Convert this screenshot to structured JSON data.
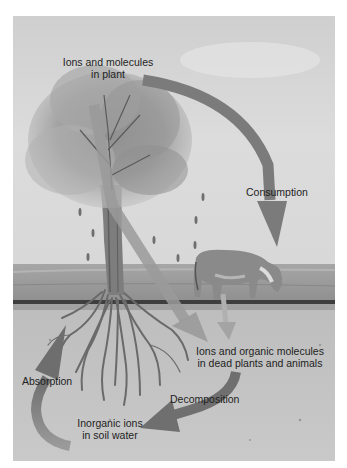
{
  "diagram": {
    "colors": {
      "background": "#ffffff",
      "sky": "#d6d6d6",
      "arrow": "#7b7b7b",
      "arrow_light": "#a8a8a8",
      "grass": "#9c9c9c",
      "soil": "#c4c4c4",
      "ground_line": "#3a3a3a",
      "text": "#1e1e1e"
    },
    "labels": {
      "plant": {
        "line1": "Ions and molecules",
        "line2": "in plant"
      },
      "consumption": "Consumption",
      "dead": {
        "line1": "Ions and organic molecules",
        "line2": "in dead plants and animals"
      },
      "decomposition": "Decomposition",
      "soil": {
        "line1": "Inorganic ions",
        "line2": "in soil water"
      },
      "absorption": "Absorption"
    },
    "elements": [
      "tree",
      "cow",
      "roots",
      "ground",
      "sky"
    ],
    "arrows": [
      {
        "name": "consumption",
        "from": "plant",
        "to": "cow"
      },
      {
        "name": "plant-to-dead",
        "from": "plant",
        "to": "dead plants and animals"
      },
      {
        "name": "animal-to-dead",
        "from": "cow",
        "to": "dead plants and animals"
      },
      {
        "name": "decomposition",
        "from": "dead plants and animals",
        "to": "soil water"
      },
      {
        "name": "absorption",
        "from": "soil water",
        "to": "plant roots"
      }
    ]
  }
}
